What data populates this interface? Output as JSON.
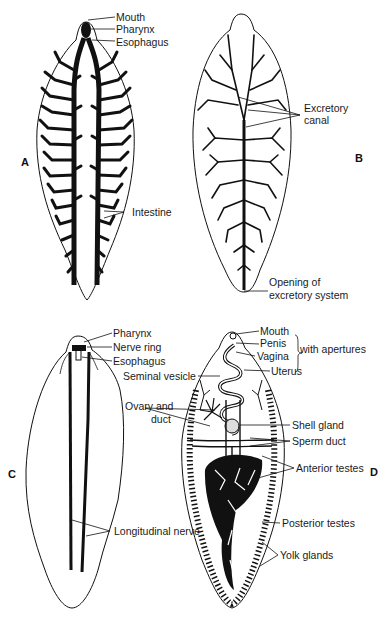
{
  "figure": {
    "panels": [
      {
        "id": "A",
        "letter": "A",
        "subject": "digestive system",
        "labels": [
          "Mouth",
          "Pharynx",
          "Esophagus",
          "Intestine"
        ]
      },
      {
        "id": "B",
        "letter": "B",
        "subject": "excretory system",
        "labels": [
          "Excretory",
          "canal",
          "Opening of",
          "excretory system"
        ]
      },
      {
        "id": "C",
        "letter": "C",
        "subject": "nervous system",
        "labels": [
          "Pharynx",
          "Nerve ring",
          "Esophagus",
          "Longitudinal nerve"
        ]
      },
      {
        "id": "D",
        "letter": "D",
        "subject": "reproductive system",
        "labels": [
          "Mouth",
          "Penis",
          "Vagina",
          "with apertures",
          "Seminal vesicle",
          "Uterus",
          "Ovary and",
          "duct",
          "Shell gland",
          "Sperm duct",
          "Anterior testes",
          "Posterior testes",
          "Yolk glands"
        ]
      }
    ]
  },
  "colors": {
    "ink": "#111111",
    "background": "#ffffff"
  }
}
